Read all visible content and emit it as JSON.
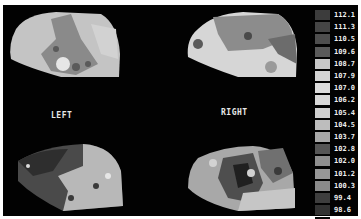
{
  "figure": {
    "labels": {
      "left": "LEFT",
      "right": "RIGHT"
    },
    "panels": [
      {
        "name": "left-top-map",
        "side": "left",
        "view": "top"
      },
      {
        "name": "right-top-map",
        "side": "right",
        "view": "top"
      },
      {
        "name": "left-bottom-map",
        "side": "left",
        "view": "bottom"
      },
      {
        "name": "right-bottom-map",
        "side": "right",
        "view": "bottom"
      }
    ],
    "legend": {
      "values": [
        "112.1",
        "111.3",
        "110.5",
        "109.6",
        "108.7",
        "107.9",
        "107.0",
        "106.2",
        "105.4",
        "104.5",
        "103.7",
        "102.8",
        "102.0",
        "101.2",
        "100.3",
        "99.4",
        "98.6",
        "97.7",
        "96.9",
        "96.1"
      ],
      "colors": [
        "#3c3c3c",
        "#454545",
        "#4e4e4e",
        "#5a5a5a",
        "#c8c8c8",
        "#d4d4d4",
        "#dcdcdc",
        "#d8d8d8",
        "#cfcfcf",
        "#bdbdbd",
        "#a8a8a8",
        "#555555",
        "#8e8e8e",
        "#979797",
        "#8a8a8a",
        "#3e3e3e",
        "#323232",
        "#050505",
        "#050505",
        "#050505"
      ]
    }
  }
}
